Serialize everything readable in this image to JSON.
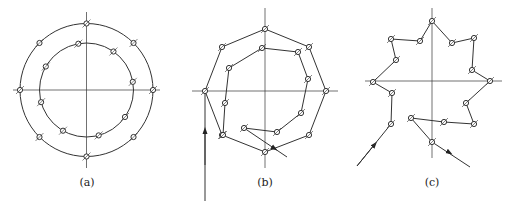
{
  "figures": [
    {
      "id": "a",
      "caption": "(a)",
      "description": "Two concentric circles with marked points, crosshair axes",
      "center": [
        86.5,
        90
      ],
      "outer_radius": 66.5,
      "inner_radius": 47,
      "outer_points_deg": [
        90,
        45,
        0,
        -45,
        -90,
        -135,
        180,
        135
      ],
      "inner_points_deg": [
        100,
        55,
        10,
        -35,
        -75,
        -120,
        -165,
        150
      ]
    },
    {
      "id": "b",
      "caption": "(b)",
      "description": "Outer octagon path and inner spiral-like polyline with entry and exit arrows",
      "outer_path": [
        [
          205,
          210
        ],
        [
          205,
          91
        ],
        [
          222,
          47
        ],
        [
          265,
          29
        ],
        [
          309,
          47
        ],
        [
          326,
          91
        ],
        [
          309,
          135
        ],
        [
          265,
          152
        ],
        [
          222,
          135
        ],
        [
          205,
          91
        ]
      ],
      "inner_path": [
        [
          244,
          128
        ],
        [
          277,
          132
        ],
        [
          301,
          113
        ],
        [
          308,
          79
        ],
        [
          298,
          52
        ],
        [
          262,
          48
        ],
        [
          229,
          68
        ],
        [
          225,
          103
        ],
        [
          223,
          135
        ]
      ],
      "entry_arrow": [
        [
          205,
          165
        ],
        [
          205,
          130
        ]
      ],
      "exit_line": [
        [
          244,
          128
        ],
        [
          287,
          157
        ]
      ]
    },
    {
      "id": "c",
      "caption": "(c)",
      "description": "Star-shaped polyline with marked vertices and entry and exit arrows",
      "path": [
        [
          357,
          166
        ],
        [
          391,
          124
        ],
        [
          392,
          93
        ],
        [
          373,
          82
        ],
        [
          396,
          60
        ],
        [
          391,
          39
        ],
        [
          420,
          41
        ],
        [
          432,
          21
        ],
        [
          452,
          43
        ],
        [
          474,
          38
        ],
        [
          472,
          70
        ],
        [
          490,
          81
        ],
        [
          466,
          103
        ],
        [
          474,
          124
        ],
        [
          444,
          122
        ],
        [
          411,
          118
        ]
      ],
      "entry_arrow": [
        [
          357,
          166
        ],
        [
          375,
          144
        ]
      ],
      "exit_path": [
        [
          411,
          118
        ],
        [
          432,
          142
        ],
        [
          470,
          167
        ]
      ],
      "exit_arrow_at": [
        450,
        153
      ],
      "axis_center": [
        432,
        81
      ]
    }
  ]
}
